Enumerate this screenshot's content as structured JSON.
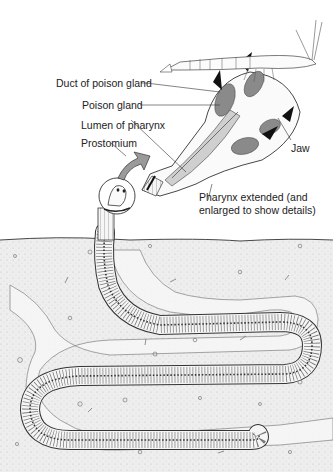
{
  "diagram": {
    "labels": {
      "duct_of_poison_gland": "Duct of poison gland",
      "poison_gland": "Poison gland",
      "lumen_of_pharynx": "Lumen of pharynx",
      "prostomium": "Prostomium",
      "jaw": "Jaw",
      "pharynx_line1": "Pharynx extended (and",
      "pharynx_line2": "enlarged to show details)"
    },
    "colors": {
      "line": "#222222",
      "gland_gray": "#8a8a8a",
      "jaw_black": "#111111",
      "arrow_gray": "#9a9a9a",
      "soil": "#ececec",
      "worm_fill": "#f4f4f4"
    }
  }
}
